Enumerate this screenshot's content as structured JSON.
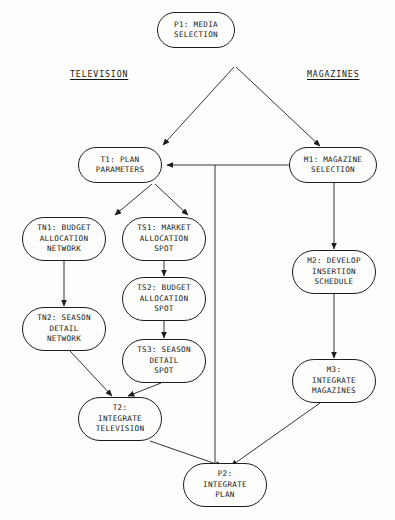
{
  "diagram": {
    "title_nodes": [
      {
        "id": "P1",
        "text": "P1: MEDIA\nSELECTION",
        "name": "node-p1-media-selection",
        "x": 196,
        "y": 30,
        "w": 78,
        "h": 36
      },
      {
        "id": "T1",
        "text": "T1: PLAN\nPARAMETERS",
        "name": "node-t1-plan-parameters",
        "x": 120,
        "y": 165,
        "w": 84,
        "h": 36
      },
      {
        "id": "M1",
        "text": "M1: MAGAZINE\nSELECTION",
        "name": "node-m1-magazine-selection",
        "x": 333,
        "y": 165,
        "w": 88,
        "h": 36
      },
      {
        "id": "TN1",
        "text": "TN1: BUDGET\nALLOCATION\nNETWORK",
        "name": "node-tn1-budget-allocation-network",
        "x": 64,
        "y": 239,
        "w": 84,
        "h": 44
      },
      {
        "id": "TS1",
        "text": "TS1: MARKET\nALLOCATION\nSPOT",
        "name": "node-ts1-market-allocation-spot",
        "x": 164,
        "y": 239,
        "w": 84,
        "h": 44
      },
      {
        "id": "TS2",
        "text": "TS2: BUDGET\nALLOCATION\nSPOT",
        "name": "node-ts2-budget-allocation-spot",
        "x": 164,
        "y": 299,
        "w": 84,
        "h": 44
      },
      {
        "id": "TN2",
        "text": "TN2: SEASON\nDETAIL\nNETWORK",
        "name": "node-tn2-season-detail-network",
        "x": 64,
        "y": 329,
        "w": 84,
        "h": 44
      },
      {
        "id": "M2",
        "text": "M2: DEVELOP\nINSERTION\nSCHEDULE",
        "name": "node-m2-develop-insertion-schedule",
        "x": 334,
        "y": 272,
        "w": 84,
        "h": 44
      },
      {
        "id": "TS3",
        "text": "TS3: SEASON\nDETAIL\nSPOT",
        "name": "node-ts3-season-detail-spot",
        "x": 164,
        "y": 361,
        "w": 84,
        "h": 44
      },
      {
        "id": "M3",
        "text": "M3:\nINTEGRATE\nMAGAZINES",
        "name": "node-m3-integrate-magazines",
        "x": 334,
        "y": 381,
        "w": 84,
        "h": 44
      },
      {
        "id": "T2",
        "text": "T2:\nINTEGRATE\nTELEVISION",
        "name": "node-t2-integrate-television",
        "x": 120,
        "y": 419,
        "w": 84,
        "h": 44
      },
      {
        "id": "P2",
        "text": "P2:\nINTEGRATE\nPLAN",
        "name": "node-p2-integrate-plan",
        "x": 225,
        "y": 485,
        "w": 84,
        "h": 44
      }
    ],
    "column_headers": [
      {
        "label": "TELEVISION",
        "name": "column-header-television",
        "x": 70,
        "y": 74
      },
      {
        "label": "MAGAZINES",
        "name": "column-header-magazines",
        "x": 307,
        "y": 74
      }
    ],
    "edges": [
      {
        "from": "P1",
        "to": "T1",
        "name": "edge-p1-to-t1",
        "arrow": true
      },
      {
        "from": "P1",
        "to": "M1",
        "name": "edge-p1-to-m1",
        "arrow": true
      },
      {
        "from": "M1",
        "to": "T1",
        "name": "edge-m1-to-t1",
        "arrow": true
      },
      {
        "from": "M1",
        "to": "M2",
        "name": "edge-m1-to-m2",
        "arrow": true
      },
      {
        "from": "T1",
        "to": "TN1",
        "name": "edge-t1-to-tn1",
        "arrow": true
      },
      {
        "from": "T1",
        "to": "TS1",
        "name": "edge-t1-to-ts1",
        "arrow": true
      },
      {
        "from": "TN1",
        "to": "TN2",
        "name": "edge-tn1-to-tn2",
        "arrow": true
      },
      {
        "from": "TS1",
        "to": "TS2",
        "name": "edge-ts1-to-ts2",
        "arrow": true
      },
      {
        "from": "TS2",
        "to": "TS3",
        "name": "edge-ts2-to-ts3",
        "arrow": true
      },
      {
        "from": "TN2",
        "to": "T2",
        "name": "edge-tn2-to-t2",
        "arrow": true
      },
      {
        "from": "TS3",
        "to": "T2",
        "name": "edge-ts3-to-t2",
        "arrow": true
      },
      {
        "from": "M2",
        "to": "M3",
        "name": "edge-m2-to-m3",
        "arrow": true
      },
      {
        "from": "T2",
        "to": "P2",
        "name": "edge-t2-to-p2",
        "arrow": true
      },
      {
        "from": "M3",
        "to": "P2",
        "name": "edge-m3-to-p2",
        "arrow": true
      },
      {
        "from": "junction",
        "to": "P2",
        "name": "edge-junction-to-p2",
        "arrow": false
      }
    ],
    "colors": {
      "stroke": "#1d1d1d",
      "text": "#171717",
      "background": "#fdfdfc"
    }
  }
}
